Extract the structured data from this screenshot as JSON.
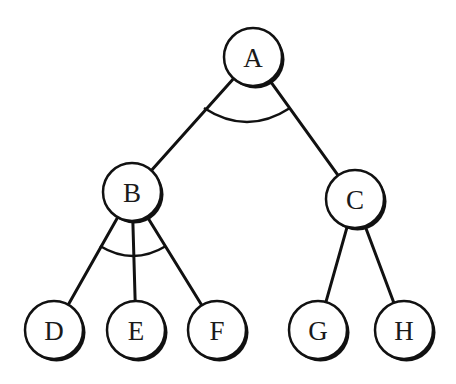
{
  "diagram": {
    "type": "and-or-tree",
    "colors": {
      "stroke": "#111111",
      "fill": "#ffffff",
      "shadow": "#111111",
      "label": "#1a1a1a"
    },
    "nodes": [
      {
        "id": "A",
        "label": "A",
        "x": 253,
        "y": 57
      },
      {
        "id": "B",
        "label": "B",
        "x": 132,
        "y": 192
      },
      {
        "id": "C",
        "label": "C",
        "x": 355,
        "y": 199
      },
      {
        "id": "D",
        "label": "D",
        "x": 54,
        "y": 330
      },
      {
        "id": "E",
        "label": "E",
        "x": 136,
        "y": 330
      },
      {
        "id": "F",
        "label": "F",
        "x": 217,
        "y": 330
      },
      {
        "id": "G",
        "label": "G",
        "x": 318,
        "y": 330
      },
      {
        "id": "H",
        "label": "H",
        "x": 404,
        "y": 330
      }
    ],
    "node_radius": 29,
    "edges": [
      {
        "from": "A",
        "to": "B"
      },
      {
        "from": "A",
        "to": "C"
      },
      {
        "from": "B",
        "to": "D"
      },
      {
        "from": "B",
        "to": "E"
      },
      {
        "from": "B",
        "to": "F"
      },
      {
        "from": "C",
        "to": "G"
      },
      {
        "from": "C",
        "to": "H"
      }
    ],
    "and_arcs": [
      {
        "parent": "A",
        "children": [
          "B",
          "C"
        ],
        "x1": 204,
        "y1": 108,
        "cx": 247,
        "cy": 136,
        "x2": 290,
        "y2": 108
      },
      {
        "parent": "B",
        "children": [
          "D",
          "E",
          "F"
        ],
        "x1": 100,
        "y1": 246,
        "cx": 133,
        "cy": 266,
        "x2": 166,
        "y2": 246
      }
    ]
  }
}
